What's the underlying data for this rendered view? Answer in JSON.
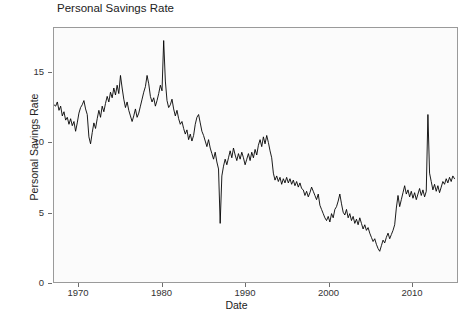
{
  "chart_data": {
    "type": "line",
    "title": "Personal Savings Rate",
    "xlabel": "Date",
    "ylabel": "Personal Savings Rate",
    "grid": false,
    "legend": null,
    "xlim": [
      1967.0,
      2015.5
    ],
    "ylim": [
      0,
      18.2
    ],
    "xticks": [
      1970,
      1980,
      1990,
      2000,
      2010
    ],
    "xtick_labels": [
      "1970",
      "1980",
      "1990",
      "2000",
      "2010"
    ],
    "yticks": [
      0,
      5,
      10,
      15
    ],
    "ytick_labels": [
      "0",
      "5",
      "10",
      "15"
    ],
    "line_color": "#000000",
    "line_width": 0.9,
    "series_name": "Personal Savings Rate",
    "x": [
      1967.0,
      1967.2,
      1967.4,
      1967.6,
      1967.8,
      1968.0,
      1968.2,
      1968.4,
      1968.6,
      1968.8,
      1969.0,
      1969.2,
      1969.4,
      1969.6,
      1969.8,
      1970.0,
      1970.2,
      1970.4,
      1970.6,
      1970.8,
      1971.0,
      1971.2,
      1971.4,
      1971.6,
      1971.8,
      1972.0,
      1972.2,
      1972.4,
      1972.6,
      1972.8,
      1973.0,
      1973.2,
      1973.4,
      1973.6,
      1973.8,
      1974.0,
      1974.2,
      1974.4,
      1974.6,
      1974.8,
      1975.0,
      1975.2,
      1975.4,
      1975.6,
      1975.8,
      1976.0,
      1976.2,
      1976.4,
      1976.6,
      1976.8,
      1977.0,
      1977.2,
      1977.4,
      1977.6,
      1977.8,
      1978.0,
      1978.2,
      1978.4,
      1978.6,
      1978.8,
      1979.0,
      1979.2,
      1979.4,
      1979.6,
      1979.8,
      1980.0,
      1980.2,
      1980.4,
      1980.6,
      1980.8,
      1981.0,
      1981.2,
      1981.4,
      1981.6,
      1981.8,
      1982.0,
      1982.2,
      1982.4,
      1982.6,
      1982.8,
      1983.0,
      1983.2,
      1983.4,
      1983.6,
      1983.8,
      1984.0,
      1984.2,
      1984.4,
      1984.6,
      1984.8,
      1985.0,
      1985.2,
      1985.4,
      1985.6,
      1985.8,
      1986.0,
      1986.2,
      1986.4,
      1986.6,
      1986.8,
      1987.0,
      1987.2,
      1987.4,
      1987.6,
      1987.8,
      1988.0,
      1988.2,
      1988.4,
      1988.6,
      1988.8,
      1989.0,
      1989.2,
      1989.4,
      1989.6,
      1989.8,
      1990.0,
      1990.2,
      1990.4,
      1990.6,
      1990.8,
      1991.0,
      1991.2,
      1991.4,
      1991.6,
      1991.8,
      1992.0,
      1992.2,
      1992.4,
      1992.6,
      1992.8,
      1993.0,
      1993.2,
      1993.4,
      1993.6,
      1993.8,
      1994.0,
      1994.2,
      1994.4,
      1994.6,
      1994.8,
      1995.0,
      1995.2,
      1995.4,
      1995.6,
      1995.8,
      1996.0,
      1996.2,
      1996.4,
      1996.6,
      1996.8,
      1997.0,
      1997.2,
      1997.4,
      1997.6,
      1997.8,
      1998.0,
      1998.2,
      1998.4,
      1998.6,
      1998.8,
      1999.0,
      1999.2,
      1999.4,
      1999.6,
      1999.8,
      2000.0,
      2000.2,
      2000.4,
      2000.6,
      2000.8,
      2001.0,
      2001.2,
      2001.4,
      2001.6,
      2001.8,
      2002.0,
      2002.2,
      2002.4,
      2002.6,
      2002.8,
      2003.0,
      2003.2,
      2003.4,
      2003.6,
      2003.8,
      2004.0,
      2004.2,
      2004.4,
      2004.6,
      2004.8,
      2005.0,
      2005.2,
      2005.4,
      2005.6,
      2005.8,
      2006.0,
      2006.2,
      2006.4,
      2006.6,
      2006.8,
      2007.0,
      2007.2,
      2007.4,
      2007.6,
      2007.8,
      2008.0,
      2008.2,
      2008.4,
      2008.6,
      2008.8,
      2009.0,
      2009.2,
      2009.4,
      2009.6,
      2009.8,
      2010.0,
      2010.2,
      2010.4,
      2010.6,
      2010.8,
      2011.0,
      2011.2,
      2011.4,
      2011.6,
      2011.8,
      2012.0,
      2012.2,
      2012.4,
      2012.6,
      2012.8,
      2013.0,
      2013.2,
      2013.4,
      2013.6,
      2013.8,
      2014.0,
      2014.2,
      2014.4,
      2014.6,
      2014.8,
      2015.0,
      2015.2
    ],
    "y": [
      12.7,
      12.6,
      12.9,
      12.3,
      12.6,
      11.9,
      12.2,
      11.6,
      11.8,
      11.3,
      11.7,
      11.2,
      11.5,
      10.8,
      11.4,
      12.1,
      12.5,
      12.7,
      13.0,
      12.4,
      12.0,
      10.4,
      9.9,
      10.7,
      11.4,
      11.0,
      11.7,
      12.3,
      11.8,
      12.6,
      12.2,
      12.8,
      13.3,
      12.9,
      13.6,
      13.2,
      13.9,
      13.4,
      14.1,
      13.5,
      14.8,
      13.9,
      13.1,
      12.5,
      12.9,
      12.3,
      11.9,
      11.5,
      11.9,
      12.4,
      11.8,
      12.1,
      12.6,
      13.1,
      13.6,
      14.0,
      14.8,
      14.2,
      13.3,
      12.9,
      13.2,
      12.6,
      13.0,
      13.5,
      14.1,
      13.7,
      17.3,
      14.4,
      13.0,
      12.5,
      12.7,
      13.1,
      12.4,
      11.9,
      12.3,
      11.7,
      11.3,
      11.5,
      11.0,
      10.6,
      10.9,
      10.2,
      10.6,
      10.1,
      10.5,
      11.3,
      11.8,
      12.0,
      11.4,
      10.8,
      10.5,
      10.1,
      9.7,
      10.2,
      9.6,
      9.2,
      8.8,
      9.3,
      8.6,
      8.1,
      4.2,
      7.6,
      8.3,
      8.8,
      8.4,
      8.9,
      9.4,
      8.9,
      9.6,
      9.1,
      8.7,
      9.2,
      8.8,
      9.3,
      8.9,
      8.4,
      8.8,
      9.2,
      8.7,
      9.3,
      8.9,
      9.5,
      9.1,
      9.8,
      10.2,
      9.7,
      10.4,
      9.9,
      10.5,
      10.0,
      9.4,
      8.9,
      7.8,
      7.3,
      7.6,
      7.2,
      7.5,
      7.0,
      7.4,
      7.1,
      7.5,
      7.1,
      7.4,
      7.0,
      7.3,
      6.9,
      7.2,
      6.8,
      7.1,
      6.7,
      6.6,
      6.2,
      6.5,
      6.1,
      6.4,
      6.8,
      6.5,
      6.2,
      5.9,
      6.3,
      5.5,
      5.2,
      4.9,
      4.6,
      4.4,
      4.7,
      4.3,
      4.9,
      4.6,
      5.2,
      5.4,
      5.8,
      6.3,
      5.6,
      5.0,
      4.8,
      5.2,
      4.6,
      4.9,
      4.4,
      4.7,
      4.2,
      4.5,
      4.1,
      4.6,
      4.2,
      3.8,
      4.1,
      3.7,
      3.9,
      3.5,
      3.2,
      2.9,
      3.1,
      2.7,
      2.4,
      2.2,
      2.6,
      3.0,
      2.8,
      3.2,
      3.5,
      3.1,
      3.4,
      3.7,
      4.1,
      5.3,
      6.2,
      5.4,
      5.9,
      6.4,
      6.9,
      6.3,
      6.6,
      6.1,
      6.5,
      6.0,
      6.4,
      5.9,
      6.3,
      6.7,
      6.2,
      6.6,
      6.1,
      6.5,
      12.0,
      7.8,
      7.2,
      6.6,
      7.0,
      6.5,
      6.9,
      6.4,
      6.8,
      7.2,
      7.0,
      7.4,
      7.1,
      7.5,
      7.2,
      7.6,
      7.4
    ]
  }
}
